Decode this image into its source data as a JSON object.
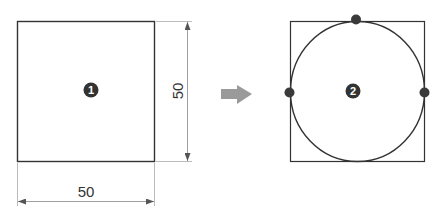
{
  "diagram": {
    "step1": {
      "marker": "1",
      "shape": "square",
      "width_label": "50",
      "height_label": "50"
    },
    "transition": {
      "icon": "right-arrow-icon",
      "color": "#9a9a9a"
    },
    "step2": {
      "marker": "2",
      "shape": "square-with-inscribed-circle",
      "tangent_points": [
        "top",
        "left",
        "right"
      ]
    },
    "colors": {
      "line": "#333333",
      "dimension_line": "#999999",
      "marker_fill": "#333333",
      "tangent_dot": "#3a3a3a"
    }
  }
}
